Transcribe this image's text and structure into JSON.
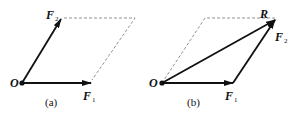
{
  "diagrams": [
    {
      "id": "a",
      "caption": "(a)",
      "origin_label": "O",
      "vectors": [
        {
          "name": "F",
          "sub": "1"
        },
        {
          "name": "F",
          "sub": "2"
        }
      ]
    },
    {
      "id": "b",
      "caption": "(b)",
      "origin_label": "O",
      "vectors": [
        {
          "name": "F",
          "sub": "1"
        },
        {
          "name": "F",
          "sub": "2"
        },
        {
          "name": "R",
          "sub": ""
        }
      ]
    }
  ],
  "colors": {
    "line": "#111111",
    "dashed": "#777777"
  }
}
